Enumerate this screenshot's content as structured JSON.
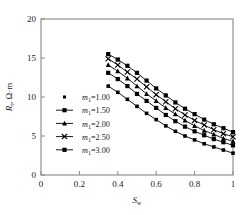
{
  "chart_data": {
    "type": "line",
    "title": "",
    "xlabel": "Sw",
    "ylabel": "Rt, Ω·m",
    "xlim": [
      0,
      1
    ],
    "ylim": [
      0,
      20
    ],
    "xticks": [
      "0",
      "0.2",
      "0.4",
      "0.6",
      "0.8",
      "1"
    ],
    "xtick_values": [
      0,
      0.2,
      0.4,
      0.6,
      0.8,
      1
    ],
    "yticks": [
      "0",
      "5",
      "10",
      "15",
      "20"
    ],
    "ytick_values": [
      0,
      5,
      10,
      15,
      20
    ],
    "grid": false,
    "legend_position": "left-center",
    "x": [
      0.35,
      0.4,
      0.45,
      0.5,
      0.55,
      0.6,
      0.65,
      0.7,
      0.75,
      0.8,
      0.85,
      0.9,
      0.95,
      1.0
    ],
    "series": [
      {
        "name": "m1=3.00",
        "marker": "square",
        "values": [
          15.5,
          14.8,
          14.0,
          13.1,
          12.1,
          11.1,
          10.2,
          9.3,
          8.5,
          7.8,
          7.1,
          6.5,
          6.0,
          5.5
        ]
      },
      {
        "name": "m1=2.50",
        "marker": "cross",
        "values": [
          14.9,
          14.1,
          13.2,
          12.3,
          11.3,
          10.3,
          9.4,
          8.5,
          7.7,
          7.0,
          6.4,
          5.8,
          5.3,
          4.9
        ]
      },
      {
        "name": "m1=2.00",
        "marker": "triangle",
        "values": [
          14.1,
          13.3,
          12.4,
          11.4,
          10.4,
          9.5,
          8.6,
          7.8,
          7.0,
          6.3,
          5.7,
          5.2,
          4.7,
          4.3
        ]
      },
      {
        "name": "m1=1.50",
        "marker": "square",
        "values": [
          13.1,
          12.3,
          11.4,
          10.4,
          9.5,
          8.6,
          7.7,
          6.9,
          6.2,
          5.6,
          5.1,
          4.6,
          4.2,
          3.8
        ]
      },
      {
        "name": "m1=1.00",
        "marker": "square-small",
        "values": [
          11.4,
          10.6,
          9.7,
          8.8,
          7.9,
          7.1,
          6.3,
          5.6,
          5.0,
          4.5,
          4.0,
          3.6,
          3.2,
          2.8
        ]
      }
    ],
    "legend": [
      {
        "label": "m1=1.00",
        "symbol": "m",
        "sub": "1",
        "value": "=1.00",
        "marker": "dot",
        "has_line": false
      },
      {
        "label": "m1=1.50",
        "symbol": "m",
        "sub": "1",
        "value": "=1.50",
        "marker": "square",
        "has_line": true
      },
      {
        "label": "m1=2.00",
        "symbol": "m",
        "sub": "1",
        "value": "=2.00",
        "marker": "triangle",
        "has_line": true
      },
      {
        "label": "m1=2.50",
        "symbol": "m",
        "sub": "1",
        "value": "=2.50",
        "marker": "cross",
        "has_line": true
      },
      {
        "label": "m1=3.00",
        "symbol": "m",
        "sub": "1",
        "value": "=3.00",
        "marker": "square",
        "has_line": true
      }
    ],
    "colors": {
      "line": "#000000",
      "marker": "#000000",
      "axis": "#888888",
      "background": "#ffffff"
    }
  },
  "axes": {
    "y_label_main": "R",
    "y_label_sub": "t",
    "y_label_unit": ", Ω·m",
    "x_label_main": "S",
    "x_label_sub": "w"
  }
}
